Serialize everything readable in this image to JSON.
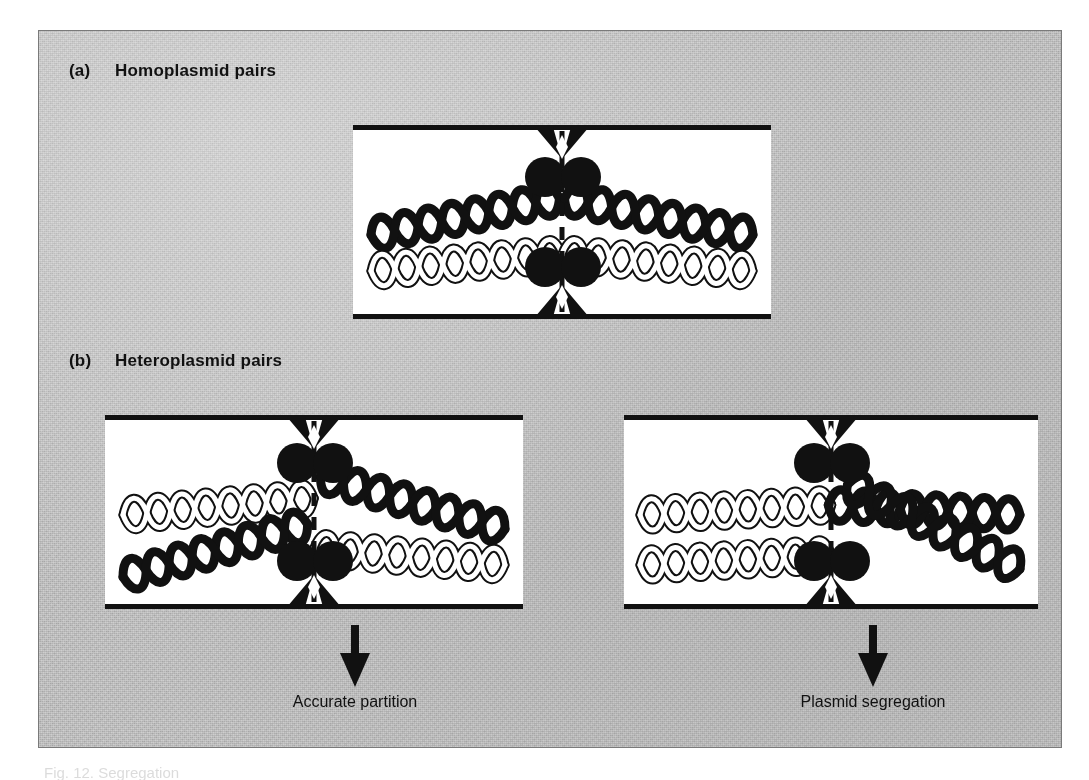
{
  "figure": {
    "panels": [
      {
        "id": "a",
        "tag": "(a)",
        "title": "Homoplasmid pairs",
        "cells": [
          {
            "name": "homoplasmid-cell",
            "strands": [
              {
                "position": "upper-left",
                "type": "black"
              },
              {
                "position": "upper-right",
                "type": "black"
              },
              {
                "position": "lower-left",
                "type": "white"
              },
              {
                "position": "lower-right",
                "type": "white"
              }
            ],
            "septum": "dashed",
            "attachment_sites": 4
          }
        ]
      },
      {
        "id": "b",
        "tag": "(b)",
        "title": "Heteroplasmid pairs",
        "cells": [
          {
            "name": "accurate-partition-cell",
            "strands": [
              {
                "position": "upper-left",
                "type": "white"
              },
              {
                "position": "upper-right",
                "type": "black"
              },
              {
                "position": "lower-left",
                "type": "black"
              },
              {
                "position": "lower-right",
                "type": "white"
              }
            ],
            "septum": "dashed",
            "attachment_sites": 4,
            "outcome": "Accurate partition"
          },
          {
            "name": "plasmid-segregation-cell",
            "strands": [
              {
                "position": "upper-left",
                "type": "white"
              },
              {
                "position": "upper-right",
                "type": "black"
              },
              {
                "position": "lower-left",
                "type": "white"
              },
              {
                "position": "lower-right",
                "type": "black"
              }
            ],
            "septum": "dashed",
            "attachment_sites": 4,
            "outcome": "Plasmid segregation"
          }
        ]
      }
    ],
    "outcomes": {
      "left": "Accurate partition",
      "right": "Plasmid segregation"
    },
    "caption_cut_off": "Fig. 12. Segregation",
    "colors": {
      "ink": "#111111",
      "plate_background": "#cfcfcf",
      "cell_background": "#ffffff",
      "plate_border": "#7a7a7a"
    }
  }
}
